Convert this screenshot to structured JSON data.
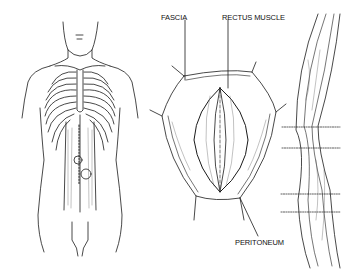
{
  "diagram": {
    "panels": [
      {
        "id": "torso",
        "description": "Front view of torso with rib cage and rectus abdominis, midline incision marked with dotted line and two circles"
      },
      {
        "id": "incision",
        "description": "Opened abdominal incision showing layers"
      },
      {
        "id": "cross-section",
        "description": "Sagittal section of abdominal wall with four dotted horizontal lines"
      }
    ],
    "labels": {
      "fascia": "FASCIA",
      "rectus_muscle": "RECTUS MUSCLE",
      "peritoneum": "PERITONEUM"
    },
    "colors": {
      "line": "#1a1a1a",
      "background": "#ffffff"
    }
  }
}
